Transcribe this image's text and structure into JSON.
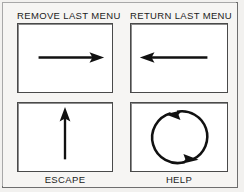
{
  "figure": {
    "background_color": "#f6f5f3",
    "frame_color": "#6e6e6e",
    "ink_color": "#111111"
  },
  "gestures": [
    {
      "id": "remove-last-menu",
      "label": "REMOVE LAST MENU",
      "label_position": "above",
      "icon": "arrow-right-icon",
      "direction": "right",
      "description": "horizontal stroke to the right"
    },
    {
      "id": "return-last-menu",
      "label": "RETURN LAST MENU",
      "label_position": "above",
      "icon": "arrow-left-icon",
      "direction": "left",
      "description": "horizontal stroke to the left"
    },
    {
      "id": "escape",
      "label": "ESCAPE",
      "label_position": "below",
      "icon": "arrow-up-icon",
      "direction": "up",
      "description": "vertical stroke upward"
    },
    {
      "id": "help",
      "label": "HELP",
      "label_position": "below",
      "icon": "circular-arrow-icon",
      "direction": "counterclockwise",
      "description": "closed circular stroke, counterclockwise"
    }
  ]
}
